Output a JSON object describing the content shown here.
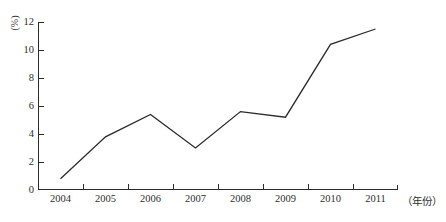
{
  "chart_data": {
    "type": "line",
    "title": "",
    "subtitle": "",
    "xlabel": "（年份）",
    "ylabel": "(%)",
    "categories": [
      "2004",
      "2005",
      "2006",
      "2007",
      "2008",
      "2009",
      "2010",
      "2011"
    ],
    "values": [
      0.8,
      3.8,
      5.4,
      3.0,
      5.6,
      5.2,
      10.4,
      11.5
    ],
    "series": [
      {
        "name": "",
        "values": [
          0.8,
          3.8,
          5.4,
          3.0,
          5.6,
          5.2,
          10.4,
          11.5
        ]
      }
    ],
    "ylim": [
      0,
      12
    ],
    "yticks": [
      0,
      2,
      4,
      6,
      8,
      10,
      12
    ],
    "ytick_labels": [
      "0",
      "2",
      "4",
      "6",
      "8",
      "10",
      "12"
    ],
    "grid": false,
    "legend": false,
    "legend_position": "none",
    "line_color": "#2b2b2b",
    "axis_color": "#2b2b2b",
    "markers": false,
    "annotations": []
  },
  "axes": {
    "y_unit_label": "(%)",
    "x_unit_label": "（年份）"
  }
}
